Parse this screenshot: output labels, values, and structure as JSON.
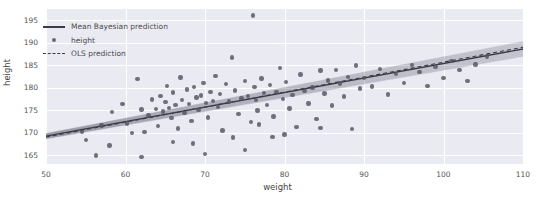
{
  "chart_data": {
    "type": "scatter",
    "title": "",
    "xlabel": "weight",
    "ylabel": "height",
    "xlim": [
      50,
      110
    ],
    "ylim": [
      163,
      197.5
    ],
    "xticks": [
      50,
      60,
      70,
      80,
      90,
      100,
      110
    ],
    "yticks": [
      165,
      170,
      175,
      180,
      185,
      190,
      195
    ],
    "grid": true,
    "legend_position": "upper left",
    "legend": [
      {
        "label": "Mean Bayesian prediction",
        "key": "solid-line",
        "color": "#3b3b46"
      },
      {
        "label": "height",
        "key": "dot-marker",
        "color": "#4f5561"
      },
      {
        "label": "OLS prediction",
        "key": "dashed-line",
        "color": "#3b3b46"
      }
    ],
    "series": [
      {
        "name": "height",
        "type": "scatter",
        "marker_color": "#4f5561",
        "points": [
          [
            54.5,
            170.1
          ],
          [
            55.0,
            168.4
          ],
          [
            56.3,
            164.9
          ],
          [
            57.0,
            171.6
          ],
          [
            58.3,
            174.6
          ],
          [
            59.6,
            176.3
          ],
          [
            60.2,
            172.0
          ],
          [
            60.8,
            169.9
          ],
          [
            61.5,
            181.9
          ],
          [
            62.0,
            175.1
          ],
          [
            62.4,
            170.2
          ],
          [
            62.9,
            173.8
          ],
          [
            63.3,
            177.4
          ],
          [
            63.8,
            175.3
          ],
          [
            64.1,
            171.5
          ],
          [
            64.4,
            178.2
          ],
          [
            64.7,
            174.7
          ],
          [
            65.0,
            176.8
          ],
          [
            65.2,
            180.4
          ],
          [
            65.5,
            175.5
          ],
          [
            65.8,
            173.2
          ],
          [
            66.0,
            178.9
          ],
          [
            66.3,
            176.1
          ],
          [
            66.6,
            170.9
          ],
          [
            66.9,
            182.3
          ],
          [
            67.1,
            177.2
          ],
          [
            67.4,
            174.3
          ],
          [
            67.7,
            179.6
          ],
          [
            68.0,
            176.4
          ],
          [
            68.3,
            172.6
          ],
          [
            68.6,
            180.1
          ],
          [
            68.9,
            177.8
          ],
          [
            69.2,
            175.0
          ],
          [
            69.5,
            178.3
          ],
          [
            69.8,
            181.0
          ],
          [
            70.1,
            176.6
          ],
          [
            70.4,
            173.4
          ],
          [
            70.7,
            179.1
          ],
          [
            71.0,
            177.0
          ],
          [
            71.3,
            182.6
          ],
          [
            71.6,
            175.7
          ],
          [
            71.9,
            178.6
          ],
          [
            72.2,
            170.5
          ],
          [
            72.6,
            180.8
          ],
          [
            73.0,
            176.9
          ],
          [
            73.4,
            186.7
          ],
          [
            73.8,
            179.4
          ],
          [
            74.2,
            174.1
          ],
          [
            74.6,
            177.6
          ],
          [
            75.0,
            181.5
          ],
          [
            75.4,
            178.1
          ],
          [
            75.8,
            172.3
          ],
          [
            76.0,
            196.1
          ],
          [
            76.2,
            180.2
          ],
          [
            76.4,
            177.3
          ],
          [
            76.6,
            174.9
          ],
          [
            76.8,
            171.8
          ],
          [
            77.1,
            182.0
          ],
          [
            77.4,
            178.8
          ],
          [
            77.8,
            176.2
          ],
          [
            78.2,
            180.6
          ],
          [
            78.6,
            173.6
          ],
          [
            79.0,
            179.0
          ],
          [
            79.4,
            184.4
          ],
          [
            79.8,
            177.5
          ],
          [
            80.2,
            181.2
          ],
          [
            80.6,
            175.4
          ],
          [
            81.0,
            178.4
          ],
          [
            81.5,
            171.3
          ],
          [
            82.0,
            182.9
          ],
          [
            82.5,
            179.3
          ],
          [
            83.0,
            176.5
          ],
          [
            83.5,
            180.0
          ],
          [
            84.0,
            173.0
          ],
          [
            84.5,
            183.8
          ],
          [
            85.0,
            178.7
          ],
          [
            85.5,
            181.6
          ],
          [
            86.0,
            176.0
          ],
          [
            86.5,
            184.0
          ],
          [
            87.0,
            180.9
          ],
          [
            87.5,
            178.0
          ],
          [
            88.0,
            182.4
          ],
          [
            88.5,
            170.8
          ],
          [
            89.0,
            184.9
          ],
          [
            89.5,
            179.8
          ],
          [
            90.0,
            182.1
          ],
          [
            91.0,
            180.3
          ],
          [
            92.0,
            184.2
          ],
          [
            93.0,
            178.5
          ],
          [
            94.0,
            183.1
          ],
          [
            95.0,
            181.0
          ],
          [
            96.0,
            185.0
          ],
          [
            97.0,
            183.5
          ],
          [
            98.0,
            180.4
          ],
          [
            99.0,
            184.6
          ],
          [
            100.0,
            182.2
          ],
          [
            101.0,
            186.0
          ],
          [
            102.0,
            183.9
          ],
          [
            103.0,
            181.5
          ],
          [
            104.0,
            185.2
          ],
          [
            105.5,
            186.9
          ],
          [
            62.0,
            164.6
          ],
          [
            70.0,
            165.2
          ],
          [
            75.0,
            166.1
          ],
          [
            68.5,
            167.6
          ],
          [
            73.5,
            168.9
          ],
          [
            80.0,
            169.6
          ],
          [
            58.0,
            167.1
          ],
          [
            84.5,
            171.0
          ],
          [
            78.5,
            169.0
          ],
          [
            66.0,
            167.9
          ]
        ]
      },
      {
        "name": "Mean Bayesian prediction",
        "type": "line",
        "color": "#3b3b46",
        "endpoints": [
          [
            50,
            169.2
          ],
          [
            110,
            188.6
          ]
        ]
      },
      {
        "name": "OLS prediction",
        "type": "dashed-line",
        "color": "#3b3b46",
        "endpoints": [
          [
            50,
            169.0
          ],
          [
            110,
            189.0
          ]
        ]
      },
      {
        "name": "posterior-samples-band",
        "type": "band",
        "color": "#6a6a78",
        "lower": [
          [
            50,
            168.6
          ],
          [
            110,
            186.9
          ]
        ],
        "upper": [
          [
            50,
            169.8
          ],
          [
            110,
            190.3
          ]
        ]
      }
    ]
  }
}
